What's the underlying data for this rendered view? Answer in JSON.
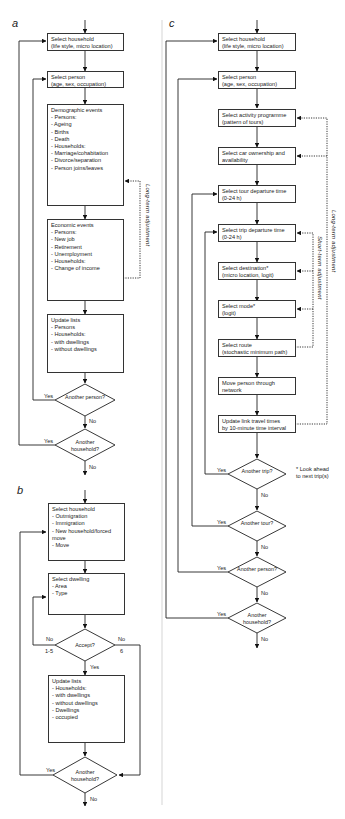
{
  "panels": {
    "a": {
      "label": "a",
      "boxes": [
        "Select household\n(life style, micro location)",
        "Select person\n(age, sex, occupation)",
        "Demographic events\n- Persons:\n   - Ageing\n   - Births\n   - Death\n- Households:\n   - Marriage/cohabitation\n   - Divorce/separation\n   - Person joins/leaves",
        "Economic events\n- Persons:\n   - New job\n   - Retirement\n   - Unemployment\n- Households:\n   - Change of income",
        "Update lists\n- Persons\n- Households:\n   - with dwellings\n   - without dwellings"
      ],
      "decisions": [
        "Another\nperson?",
        "Another\nhousehold?"
      ],
      "yes": "Yes",
      "no": "No",
      "feedback_label": "Long-term adjustment"
    },
    "b": {
      "label": "b",
      "boxes": [
        "Select household\n- Outmigration\n- Immigration\n- New household/forced move\n- Move",
        "Select dwelling\n- Area\n- Type",
        "Update lists\n- Households:\n   - with dwellings\n   - without dwellings\n- Dwellings\n   - occupied"
      ],
      "decisions": [
        "Accept?",
        "Another\nhousehold?"
      ],
      "no_left": "No",
      "no_left_range": "1-5",
      "no_right": "No",
      "no_right_value": "6",
      "yes": "Yes",
      "no": "No"
    },
    "c": {
      "label": "c",
      "boxes": [
        "Select household\n(life style, micro location)",
        "Select person\n(age, sex, occupation)",
        "Select activity programme\n(pattern of tours)",
        "Select car ownership and\navailability",
        "Select tour departure time\n(0-24 h)",
        "Select trip departure time\n(0-24 h)",
        "Select destination*\n(micro location, logit)",
        "Select mode*\n(logit)",
        "Select  route\n(stochastic minimum path)",
        "Move person through\nnetwork",
        "Update link travel times\nby 10-minute time interval"
      ],
      "decisions": [
        "Another\ntrip?",
        "Another\ntour?",
        "Another\nperson?",
        "Another\nhousehold?"
      ],
      "yes": "Yes",
      "no": "No",
      "footnote": "* Look ahead\nto next trip(s)",
      "short_term_label": "Short-term adjustment",
      "long_term_label": "Long-term adjustment"
    }
  }
}
